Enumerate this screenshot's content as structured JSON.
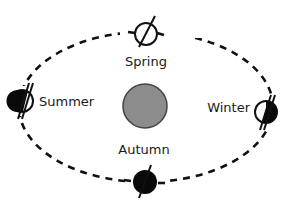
{
  "diagram": {
    "colors": {
      "orbit": "#111111",
      "sun_fill": "#8c8c8c",
      "sun_stroke": "#444444",
      "planet_dark": "#0a0a0a",
      "planet_light": "#ffffff"
    },
    "sun": {
      "label": ""
    },
    "seasons": [
      {
        "id": "spring",
        "label": "Spring"
      },
      {
        "id": "summer",
        "label": "Summer"
      },
      {
        "id": "winter",
        "label": "Winter"
      },
      {
        "id": "autumn",
        "label": "Autumn"
      }
    ]
  }
}
